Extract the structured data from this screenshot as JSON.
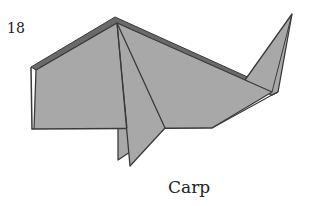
{
  "step": {
    "number": "18"
  },
  "caption": {
    "text": "Carp"
  },
  "colors": {
    "paper_fill": "#a8a8a8",
    "edge_dark": "#3a3a3a",
    "edge_shadow": "#6a6a6a",
    "background": "#ffffff"
  },
  "diagram": {
    "parts": [
      "body",
      "dorsal edge",
      "tail",
      "pelvic fin back",
      "pelvic fin front",
      "crease lines"
    ]
  }
}
